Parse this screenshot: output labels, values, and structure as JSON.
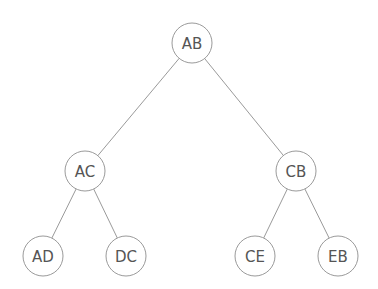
{
  "diagram": {
    "type": "binary-tree",
    "colors": {
      "stroke": "#9a9a9a",
      "text": "#555555",
      "background": "#ffffff"
    },
    "node_radius": 20,
    "nodes": [
      {
        "id": "AB",
        "label": "AB",
        "x": 192,
        "y": 43
      },
      {
        "id": "AC",
        "label": "AC",
        "x": 85,
        "y": 171
      },
      {
        "id": "CB",
        "label": "CB",
        "x": 296,
        "y": 171
      },
      {
        "id": "AD",
        "label": "AD",
        "x": 43,
        "y": 256
      },
      {
        "id": "DC",
        "label": "DC",
        "x": 126,
        "y": 256
      },
      {
        "id": "CE",
        "label": "CE",
        "x": 255,
        "y": 256
      },
      {
        "id": "EB",
        "label": "EB",
        "x": 338,
        "y": 256
      }
    ],
    "edges": [
      {
        "from": "AB",
        "to": "AC"
      },
      {
        "from": "AB",
        "to": "CB"
      },
      {
        "from": "AC",
        "to": "AD"
      },
      {
        "from": "AC",
        "to": "DC"
      },
      {
        "from": "CB",
        "to": "CE"
      },
      {
        "from": "CB",
        "to": "EB"
      }
    ]
  }
}
